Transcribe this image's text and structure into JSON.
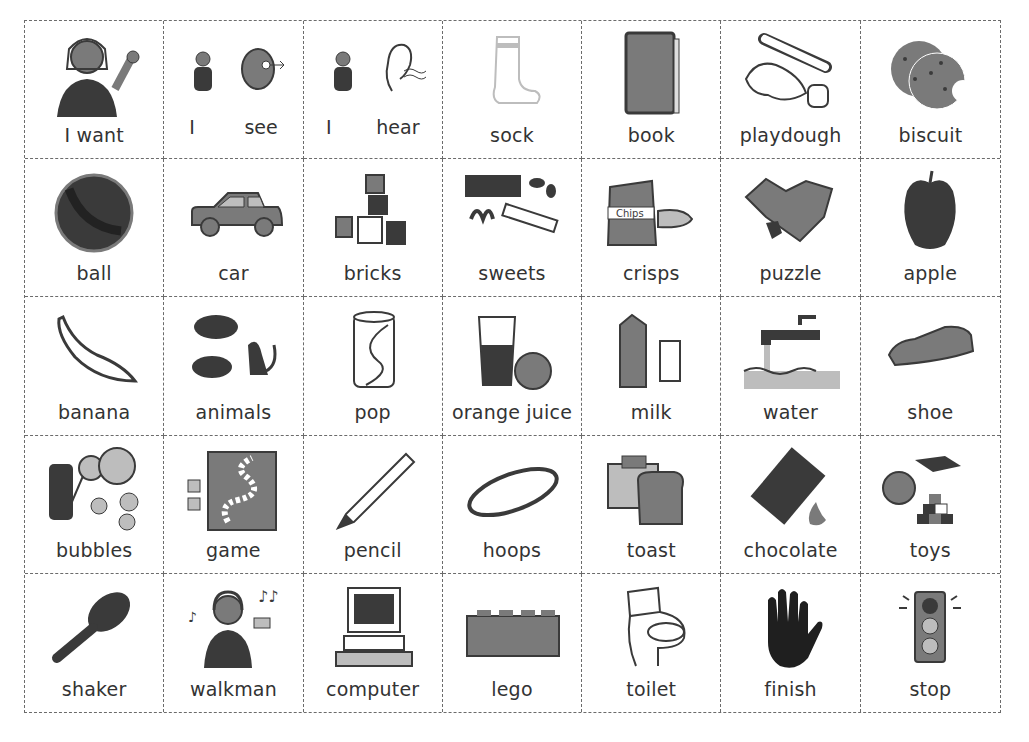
{
  "board": {
    "rows": [
      [
        {
          "type": "pair",
          "labels": [
            "I want"
          ],
          "icon": "person-signing-want-icon"
        },
        {
          "type": "pair",
          "labels": [
            "I",
            "see"
          ],
          "icon": "person-and-eye-icon"
        },
        {
          "type": "pair",
          "labels": [
            "I",
            "hear"
          ],
          "icon": "person-and-ear-icon"
        },
        {
          "label": "sock",
          "icon": "sock-icon"
        },
        {
          "label": "book",
          "icon": "book-icon"
        },
        {
          "label": "playdough",
          "icon": "playdough-icon"
        },
        {
          "label": "biscuit",
          "icon": "biscuit-icon"
        }
      ],
      [
        {
          "label": "ball",
          "icon": "ball-icon"
        },
        {
          "label": "car",
          "icon": "car-icon"
        },
        {
          "label": "bricks",
          "icon": "bricks-icon"
        },
        {
          "label": "sweets",
          "icon": "sweets-icon"
        },
        {
          "label": "crisps",
          "icon": "crisps-icon"
        },
        {
          "label": "puzzle",
          "icon": "puzzle-icon"
        },
        {
          "label": "apple",
          "icon": "apple-icon"
        }
      ],
      [
        {
          "label": "banana",
          "icon": "banana-icon"
        },
        {
          "label": "animals",
          "icon": "animals-icon"
        },
        {
          "label": "pop",
          "icon": "soda-can-icon"
        },
        {
          "label": "orange juice",
          "icon": "orange-juice-icon"
        },
        {
          "label": "milk",
          "icon": "milk-carton-icon"
        },
        {
          "label": "water",
          "icon": "tap-water-icon"
        },
        {
          "label": "shoe",
          "icon": "shoe-icon"
        }
      ],
      [
        {
          "label": "bubbles",
          "icon": "bubbles-icon"
        },
        {
          "label": "game",
          "icon": "board-game-icon"
        },
        {
          "label": "pencil",
          "icon": "pencil-icon"
        },
        {
          "label": "hoops",
          "icon": "hoop-icon"
        },
        {
          "label": "toast",
          "icon": "toaster-icon"
        },
        {
          "label": "chocolate",
          "icon": "chocolate-icon"
        },
        {
          "label": "toys",
          "icon": "toys-icon"
        }
      ],
      [
        {
          "label": "shaker",
          "icon": "maraca-icon"
        },
        {
          "label": "walkman",
          "icon": "walkman-icon"
        },
        {
          "label": "computer",
          "icon": "computer-icon"
        },
        {
          "label": "lego",
          "icon": "lego-brick-icon"
        },
        {
          "label": "toilet",
          "icon": "toilet-icon"
        },
        {
          "label": "finish",
          "icon": "hand-stop-icon"
        },
        {
          "label": "stop",
          "icon": "traffic-light-icon"
        }
      ]
    ]
  },
  "caption": {
    "text": "",
    "note": "illegible — clipped at the bottom edge"
  }
}
